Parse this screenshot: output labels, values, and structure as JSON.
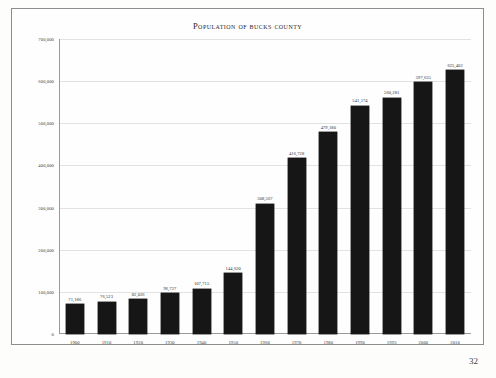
{
  "page": {
    "page_number": "32",
    "frame_color": "#8d8d8d",
    "bar_color": "#161616"
  },
  "chart_data": {
    "type": "bar",
    "title": "Population of Bucks County",
    "xlabel": "",
    "ylabel": "",
    "ylim": [
      0,
      700000
    ],
    "grid": true,
    "legend": null,
    "ytick_labels": [
      "700,000",
      "600,000",
      "500,000",
      "400,000",
      "300,000",
      "200,000",
      "100,000",
      "0"
    ],
    "yticks": [
      700000,
      600000,
      500000,
      400000,
      300000,
      200000,
      100000,
      0
    ],
    "categories": [
      "1900",
      "1910",
      "1920",
      "1930",
      "1940",
      "1950",
      "1960",
      "1970",
      "1980",
      "1990",
      "1993",
      "2000",
      "2010"
    ],
    "values": [
      71186,
      76523,
      82026,
      96727,
      107715,
      144620,
      308567,
      416728,
      479180,
      541174,
      560281,
      597635,
      625402
    ],
    "data_labels": [
      "71,186",
      "76,523",
      "82,026",
      "96,727",
      "107,715",
      "144,620",
      "308,567",
      "416,728",
      "479,180",
      "541,174",
      "560,281",
      "597,635",
      "625,402"
    ]
  }
}
